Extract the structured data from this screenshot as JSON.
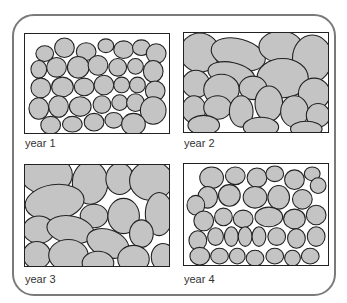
{
  "figure": {
    "cell_fill": "#c4c4c4",
    "cell_stroke": "#222222",
    "frame_stroke": "#7a7a7a",
    "panels": [
      {
        "label": "year 1",
        "cell_density": "many small cells"
      },
      {
        "label": "year 2",
        "cell_density": "fewer large cells"
      },
      {
        "label": "year 3",
        "cell_density": "fewer large cells"
      },
      {
        "label": "year 4",
        "cell_density": "many small cells"
      }
    ]
  }
}
